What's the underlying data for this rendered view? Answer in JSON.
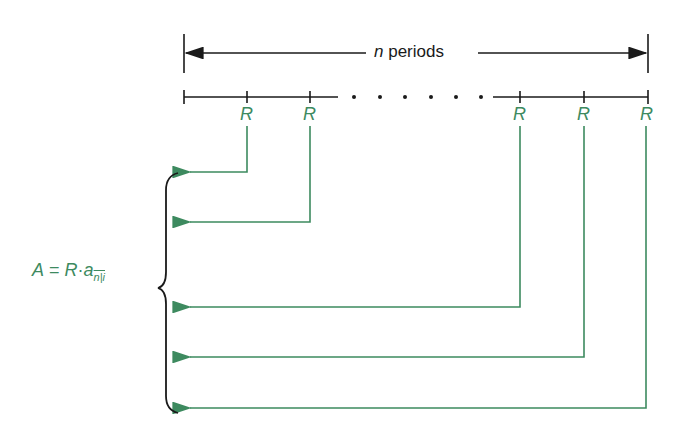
{
  "diagram": {
    "title_span": {
      "variable": "n",
      "label": "periods"
    },
    "payments": [
      {
        "label": "R",
        "x": 247,
        "arrow_y": 172
      },
      {
        "label": "R",
        "x": 310,
        "arrow_y": 222
      },
      {
        "label": "R",
        "x": 520,
        "arrow_y": 307
      },
      {
        "label": "R",
        "x": 584,
        "arrow_y": 357
      },
      {
        "label": "R",
        "x": 646,
        "arrow_y": 408
      }
    ],
    "ellipsis": "· · · · · ·",
    "formula": {
      "lhs": "A",
      "equals": "=",
      "rhs_factor": "R",
      "dot": "·",
      "annuity_symbol": "a",
      "subscript": "n|i"
    },
    "colors": {
      "green": "#3d8a5f",
      "black": "#1a1a1a"
    }
  }
}
